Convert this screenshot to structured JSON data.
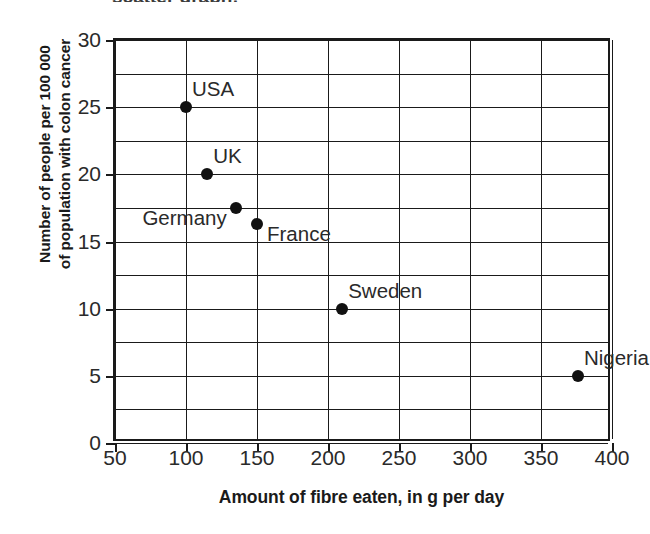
{
  "title_remnant": "scatter graph:",
  "chart_data": {
    "type": "scatter",
    "title": "",
    "xlabel": "Amount of fibre eaten, in g per day",
    "ylabel_line1": "Number of people per 100 000",
    "ylabel_line2": "of population with colon cancer",
    "xlim": [
      50,
      400
    ],
    "ylim": [
      0,
      30
    ],
    "xticks": [
      "50",
      "100",
      "150",
      "200",
      "250",
      "300",
      "350",
      "400"
    ],
    "xtick_values": [
      50,
      100,
      150,
      200,
      250,
      300,
      350,
      400
    ],
    "yticks": [
      "0",
      "5",
      "10",
      "15",
      "20",
      "25",
      "30"
    ],
    "ytick_values": [
      0,
      5,
      10,
      15,
      20,
      25,
      30
    ],
    "grid": "both",
    "grid_x_step": 50,
    "grid_y_step": 2.5,
    "legend": "none",
    "marker_color": "#111111",
    "axis_color": "#1a1a1a",
    "points": [
      {
        "label": "USA",
        "x": 100,
        "y": 25,
        "label_pos": "above-right"
      },
      {
        "label": "UK",
        "x": 115,
        "y": 20,
        "label_pos": "above-right"
      },
      {
        "label": "Germany",
        "x": 135,
        "y": 17.5,
        "label_pos": "left"
      },
      {
        "label": "France",
        "x": 150,
        "y": 16.3,
        "label_pos": "right"
      },
      {
        "label": "Sweden",
        "x": 210,
        "y": 10,
        "label_pos": "above-right"
      },
      {
        "label": "Nigeria",
        "x": 376,
        "y": 5,
        "label_pos": "above-right"
      }
    ]
  }
}
